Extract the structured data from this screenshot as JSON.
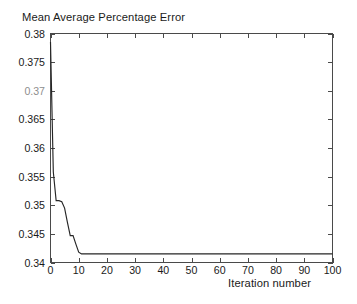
{
  "figure": {
    "background_color": "#ffffff",
    "axis_color": "#4a4a4a",
    "line_color": "#262626",
    "title": "Mean Average Percentage Error",
    "xlabel": "Iteration number"
  },
  "axes": {
    "y_tick_labels": [
      "0.38",
      "0.375",
      "0.37",
      "0.365",
      "0.36",
      "0.355",
      "0.35",
      "0.345",
      "0.34"
    ],
    "x_tick_labels": [
      "0",
      "10",
      "20",
      "30",
      "40",
      "50",
      "60",
      "70",
      "80",
      "90",
      "100"
    ]
  },
  "chart_data": {
    "type": "line",
    "title": "Mean Average Percentage Error",
    "xlabel": "Iteration number",
    "ylabel": "",
    "xlim": [
      0,
      100
    ],
    "ylim": [
      0.34,
      0.38
    ],
    "xticks": [
      0,
      10,
      20,
      30,
      40,
      50,
      60,
      70,
      80,
      90,
      100
    ],
    "yticks": [
      0.34,
      0.345,
      0.35,
      0.355,
      0.36,
      0.365,
      0.37,
      0.375,
      0.38
    ],
    "grid": false,
    "legend": false,
    "series": [
      {
        "name": "Mean Average Percentage Error",
        "color": "#262626",
        "x": [
          0,
          1,
          2,
          3,
          4,
          5,
          6,
          7,
          8,
          9,
          10,
          11,
          12,
          20,
          30,
          40,
          50,
          60,
          70,
          80,
          90,
          100
        ],
        "y": [
          0.3785,
          0.3558,
          0.3508,
          0.3508,
          0.3506,
          0.3495,
          0.347,
          0.3447,
          0.3447,
          0.3432,
          0.3418,
          0.3415,
          0.3415,
          0.3415,
          0.3415,
          0.3415,
          0.3415,
          0.3415,
          0.3415,
          0.3415,
          0.3415,
          0.3415
        ]
      }
    ]
  }
}
